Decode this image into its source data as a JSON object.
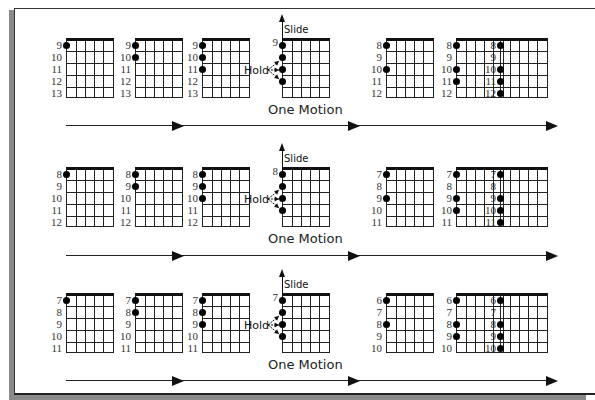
{
  "annotations": {
    "slide_label": "Slide",
    "hold_label": "Hold",
    "one_motion_label": "One Motion"
  },
  "layout": {
    "columns_x": [
      66,
      135,
      202,
      282,
      386,
      456,
      500
    ],
    "rows_y": [
      38,
      167,
      293
    ],
    "flow_arrow_y": [
      125,
      255,
      380
    ],
    "arrowheads_x": [
      172,
      348,
      546
    ]
  },
  "rows": [
    {
      "diagrams": [
        {
          "labels": [
            "9",
            "10",
            "11",
            "12",
            "13"
          ],
          "dots": [
            0
          ]
        },
        {
          "labels": [
            "9",
            "10",
            "11",
            "12",
            "13"
          ],
          "dots": [
            0,
            1
          ]
        },
        {
          "labels": [
            "9",
            "10",
            "11",
            "12",
            "13"
          ],
          "dots": [
            0,
            1,
            2
          ]
        },
        {
          "labels": [
            "9",
            "",
            "",
            "",
            ""
          ],
          "dots": [
            0,
            1,
            2,
            3
          ],
          "one_motion": true
        },
        {
          "labels": [
            "8",
            "9",
            "10",
            "11",
            "12"
          ],
          "dots": [
            0,
            2
          ]
        },
        {
          "labels": [
            "8",
            "9",
            "10",
            "11",
            "12"
          ],
          "dots": [
            0,
            2,
            3
          ]
        },
        {
          "labels": [
            "8",
            "9",
            "10",
            "11",
            "12"
          ],
          "dots": [
            0,
            2,
            3,
            4
          ]
        }
      ]
    },
    {
      "diagrams": [
        {
          "labels": [
            "8",
            "9",
            "10",
            "11",
            "12"
          ],
          "dots": [
            0
          ]
        },
        {
          "labels": [
            "8",
            "9",
            "10",
            "11",
            "12"
          ],
          "dots": [
            0,
            1
          ]
        },
        {
          "labels": [
            "8",
            "9",
            "10",
            "11",
            "12"
          ],
          "dots": [
            0,
            1,
            2
          ]
        },
        {
          "labels": [
            "8",
            "",
            "",
            "",
            ""
          ],
          "dots": [
            0,
            1,
            2,
            3
          ],
          "one_motion": true
        },
        {
          "labels": [
            "7",
            "8",
            "9",
            "10",
            "11"
          ],
          "dots": [
            0,
            2
          ]
        },
        {
          "labels": [
            "7",
            "8",
            "9",
            "10",
            "11"
          ],
          "dots": [
            0,
            2,
            3
          ]
        },
        {
          "labels": [
            "7",
            "8",
            "9",
            "10",
            "11"
          ],
          "dots": [
            0,
            2,
            3,
            4
          ]
        }
      ]
    },
    {
      "diagrams": [
        {
          "labels": [
            "7",
            "8",
            "9",
            "10",
            "11"
          ],
          "dots": [
            0
          ]
        },
        {
          "labels": [
            "7",
            "8",
            "9",
            "10",
            "11"
          ],
          "dots": [
            0,
            1
          ]
        },
        {
          "labels": [
            "7",
            "8",
            "9",
            "10",
            "11"
          ],
          "dots": [
            0,
            1,
            2
          ]
        },
        {
          "labels": [
            "7",
            "",
            "",
            "",
            ""
          ],
          "dots": [
            0,
            1,
            2,
            3
          ],
          "one_motion": true
        },
        {
          "labels": [
            "6",
            "7",
            "8",
            "9",
            "10"
          ],
          "dots": [
            0,
            2
          ]
        },
        {
          "labels": [
            "6",
            "7",
            "8",
            "9",
            "10"
          ],
          "dots": [
            0,
            2,
            3
          ]
        },
        {
          "labels": [
            "6",
            "7",
            "8",
            "9",
            "10"
          ],
          "dots": [
            0,
            2,
            3,
            4
          ]
        }
      ]
    }
  ]
}
